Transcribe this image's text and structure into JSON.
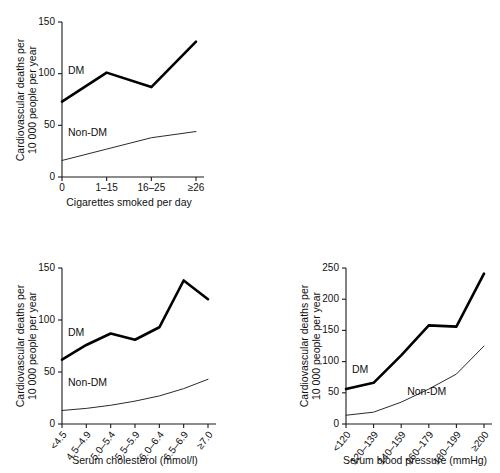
{
  "figure": {
    "series_names": {
      "dm": "DM",
      "nondm": "Non-DM"
    },
    "shared_ylabel_line1": "Cardiovascular deaths per",
    "shared_ylabel_line2": "10 000 people per year"
  },
  "chart_data": [
    {
      "id": "smoking",
      "type": "line",
      "title": "",
      "xlabel": "Cigarettes smoked per day",
      "ylabel": "Cardiovascular deaths per 10 000 people per year",
      "ylabel_lines": [
        "Cardiovascular deaths per",
        "10 000 people per year"
      ],
      "categories": [
        "0",
        "1–15",
        "16–25",
        "≥26"
      ],
      "xticklabels_rotated": false,
      "ylim": [
        0,
        150
      ],
      "yticks": [
        0,
        50,
        100,
        150
      ],
      "grid": false,
      "legend": "inline-annotations",
      "series": [
        {
          "name": "DM",
          "label": "DM",
          "style": "thick",
          "values": [
            73,
            101,
            87,
            131
          ]
        },
        {
          "name": "Non-DM",
          "label": "Non-DM",
          "style": "thin",
          "values": [
            16,
            27,
            38,
            44
          ]
        }
      ],
      "annotations": [
        {
          "text": "DM",
          "x_category": "0",
          "y_value": 100
        },
        {
          "text": "Non-DM",
          "x_category": "0",
          "y_value": 40
        }
      ]
    },
    {
      "id": "cholesterol",
      "type": "line",
      "title": "",
      "xlabel": "Serum cholesterol (mmol/l)",
      "ylabel": "Cardiovascular deaths per 10 000 people per year",
      "ylabel_lines": [
        "Cardiovascular deaths per",
        "10 000 people per year"
      ],
      "categories": [
        "<4.5",
        "4.5–4.9",
        "5.0–5.4",
        "5.5–5.9",
        "6.0–6.4",
        "6.5–6.9",
        "≥7.0"
      ],
      "xticklabels_rotated": true,
      "ylim": [
        0,
        150
      ],
      "yticks": [
        0,
        50,
        100,
        150
      ],
      "grid": false,
      "legend": "inline-annotations",
      "series": [
        {
          "name": "DM",
          "label": "DM",
          "style": "thick",
          "values": [
            62,
            76,
            87,
            81,
            93,
            138,
            120
          ]
        },
        {
          "name": "Non-DM",
          "label": "Non-DM",
          "style": "thin",
          "values": [
            13,
            15,
            18,
            22,
            27,
            34,
            43
          ]
        }
      ],
      "annotations": [
        {
          "text": "DM",
          "x_category": "<4.5",
          "y_value": 85
        },
        {
          "text": "Non-DM",
          "x_category": "<4.5",
          "y_value": 37
        }
      ]
    },
    {
      "id": "bloodpressure",
      "type": "line",
      "title": "",
      "xlabel": "Serum blood pressure (mmHg)",
      "ylabel": "Cardiovascular deaths per 10 000 people per year",
      "ylabel_lines": [
        "Cardiovascular deaths per",
        "10 000 people per year"
      ],
      "categories": [
        "<120",
        "120–139",
        "140–159",
        "160–179",
        "180–199",
        "≥200"
      ],
      "xticklabels_rotated": true,
      "ylim": [
        0,
        250
      ],
      "yticks": [
        0,
        50,
        100,
        150,
        200,
        250
      ],
      "grid": false,
      "legend": "inline-annotations",
      "series": [
        {
          "name": "DM",
          "label": "DM",
          "style": "thick",
          "values": [
            56,
            66,
            110,
            158,
            156,
            241
          ]
        },
        {
          "name": "Non-DM",
          "label": "Non-DM",
          "style": "thin",
          "values": [
            14,
            19,
            35,
            56,
            80,
            125
          ]
        }
      ],
      "annotations": [
        {
          "text": "DM",
          "x_category": "<120",
          "y_value": 82
        },
        {
          "text": "Non-DM",
          "x_category": "140–159",
          "y_value": 47
        }
      ]
    }
  ]
}
